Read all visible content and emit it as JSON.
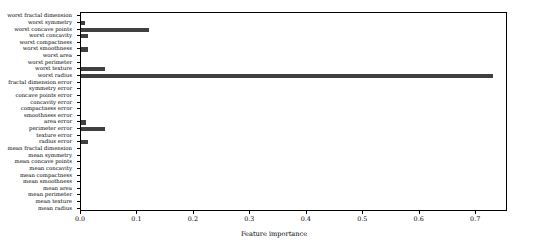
{
  "chart_data": {
    "type": "bar",
    "orientation": "horizontal",
    "title": "",
    "xlabel": "Feature importance",
    "ylabel": "",
    "xlim": [
      0.0,
      0.7564
    ],
    "grid": false,
    "legend": null,
    "bar_color": "#404040",
    "xticks": [
      0.0,
      0.1,
      0.2,
      0.3,
      0.4,
      0.5,
      0.6,
      0.7
    ],
    "xtick_labels": [
      "0.0",
      "0.1",
      "0.2",
      "0.3",
      "0.4",
      "0.5",
      "0.6",
      "0.7"
    ],
    "categories": [
      "worst fractal dimension",
      "worst symmetry",
      "worst concave points",
      "worst concavity",
      "worst compactness",
      "worst smoothness",
      "worst area",
      "worst perimeter",
      "worst texture",
      "worst radius",
      "fractal dimension error",
      "symmetry error",
      "concave points error",
      "concavity error",
      "compactness error",
      "smoothness error",
      "area error",
      "perimeter error",
      "texture error",
      "radius error",
      "mean fractal dimension",
      "mean symmetry",
      "mean concave points",
      "mean concavity",
      "mean compactness",
      "mean smoothness",
      "mean area",
      "mean perimeter",
      "mean texture",
      "mean radius"
    ],
    "values": [
      0.0,
      0.007,
      0.12,
      0.012,
      0.0,
      0.013,
      0.0,
      0.0,
      0.043,
      0.73,
      0.0,
      0.0,
      0.0,
      0.0,
      0.0,
      0.0,
      0.008,
      0.043,
      0.0,
      0.013,
      0.0,
      0.0,
      0.0,
      0.0,
      0.0,
      0.0,
      0.0,
      0.0,
      0.0,
      0.0
    ]
  }
}
